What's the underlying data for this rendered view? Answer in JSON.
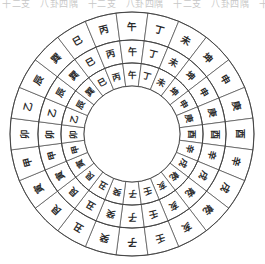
{
  "page": {
    "cropped_caption": "十二支　八卦四隅　十二支　八卦四隅　十二支　八卦四隅　十二支"
  },
  "compass": {
    "center_x": 132,
    "center_y": 126,
    "segment_count": 24,
    "inner_hub_radius": 48,
    "ring_stroke_color": "#3c3c3c",
    "segment_fill_color": "#ffffff",
    "glyph_color": "#2b2b2b",
    "rings": [
      {
        "name": "outer-ring",
        "r_inner": 94,
        "r_outer": 122,
        "glyph_class": "g-outer"
      },
      {
        "name": "middle-ring",
        "r_inner": 71,
        "r_outer": 94,
        "glyph_class": "g-mid"
      },
      {
        "name": "inner-ring",
        "r_inner": 48,
        "r_outer": 71,
        "glyph_class": "g-inner"
      }
    ],
    "mountains": [
      {
        "index": 0,
        "label": "子",
        "angle": 180,
        "group": "earthly-branch"
      },
      {
        "index": 1,
        "label": "癸",
        "angle": 195,
        "group": "heavenly-stem"
      },
      {
        "index": 2,
        "label": "丑",
        "angle": 210,
        "group": "earthly-branch"
      },
      {
        "index": 3,
        "label": "艮",
        "angle": 225,
        "group": "trigram"
      },
      {
        "index": 4,
        "label": "寅",
        "angle": 240,
        "group": "earthly-branch"
      },
      {
        "index": 5,
        "label": "甲",
        "angle": 255,
        "group": "heavenly-stem"
      },
      {
        "index": 6,
        "label": "卯",
        "angle": 270,
        "group": "earthly-branch"
      },
      {
        "index": 7,
        "label": "乙",
        "angle": 285,
        "group": "heavenly-stem"
      },
      {
        "index": 8,
        "label": "辰",
        "angle": 300,
        "group": "earthly-branch"
      },
      {
        "index": 9,
        "label": "巽",
        "angle": 315,
        "group": "trigram"
      },
      {
        "index": 10,
        "label": "巳",
        "angle": 330,
        "group": "earthly-branch"
      },
      {
        "index": 11,
        "label": "丙",
        "angle": 345,
        "group": "heavenly-stem"
      },
      {
        "index": 12,
        "label": "午",
        "angle": 0,
        "group": "earthly-branch"
      },
      {
        "index": 13,
        "label": "丁",
        "angle": 15,
        "group": "heavenly-stem"
      },
      {
        "index": 14,
        "label": "未",
        "angle": 30,
        "group": "earthly-branch"
      },
      {
        "index": 15,
        "label": "坤",
        "angle": 45,
        "group": "trigram"
      },
      {
        "index": 16,
        "label": "申",
        "angle": 60,
        "group": "earthly-branch"
      },
      {
        "index": 17,
        "label": "庚",
        "angle": 75,
        "group": "heavenly-stem"
      },
      {
        "index": 18,
        "label": "酉",
        "angle": 90,
        "group": "earthly-branch"
      },
      {
        "index": 19,
        "label": "辛",
        "angle": 105,
        "group": "heavenly-stem"
      },
      {
        "index": 20,
        "label": "戌",
        "angle": 120,
        "group": "earthly-branch"
      },
      {
        "index": 21,
        "label": "乾",
        "angle": 135,
        "group": "trigram"
      },
      {
        "index": 22,
        "label": "亥",
        "angle": 150,
        "group": "earthly-branch"
      },
      {
        "index": 23,
        "label": "壬",
        "angle": 165,
        "group": "heavenly-stem"
      }
    ]
  }
}
